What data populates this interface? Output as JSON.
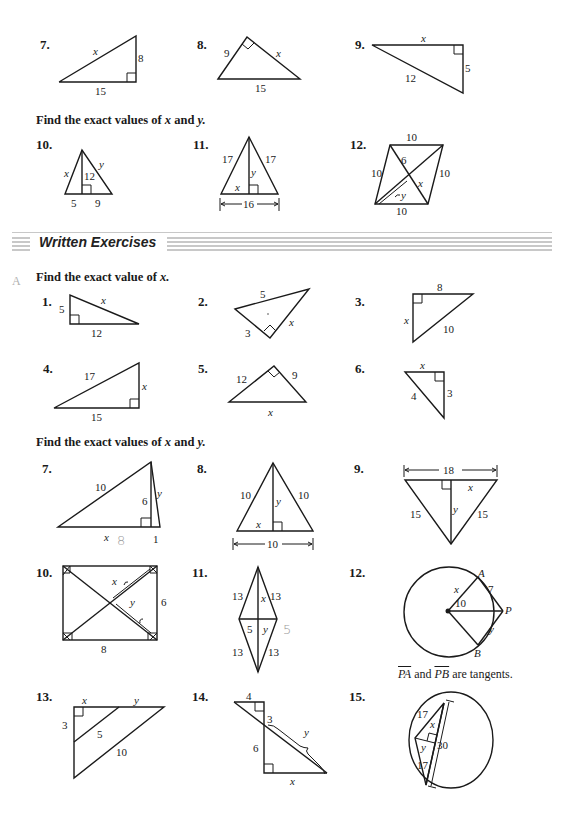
{
  "page": {
    "top_section": {
      "problems_top": [
        {
          "number": "7.",
          "labels": {
            "hyp": "x",
            "leg_vertical": "8",
            "leg_base": "15"
          }
        },
        {
          "number": "8.",
          "labels": {
            "leg_left": "9",
            "leg_right": "x",
            "hyp_base": "15"
          }
        },
        {
          "number": "9.",
          "labels": {
            "leg_top": "x",
            "leg_vertical": "5",
            "hyp": "12"
          }
        }
      ],
      "instruction_xy": "Find the exact values of",
      "instruction_xy_vars": {
        "x": "x",
        "and": "and",
        "y": "y."
      },
      "problems_xy": [
        {
          "number": "10.",
          "labels": {
            "left": "x",
            "altitude": "12",
            "right": "y",
            "base_left": "5",
            "base_right": "9"
          }
        },
        {
          "number": "11.",
          "labels": {
            "left": "17",
            "right": "17",
            "altitude": "y",
            "half_base": "x",
            "base": "16"
          }
        },
        {
          "number": "12.",
          "labels": {
            "top": "10",
            "left": "10",
            "right": "10",
            "bottom": "10",
            "half_diag": "6",
            "segment_x": "x",
            "segment_y": "y"
          }
        }
      ]
    },
    "section_banner": {
      "title": "Written Exercises"
    },
    "written": {
      "margin_label": "A",
      "instruction_x": "Find the exact value of",
      "instruction_x_var": "x.",
      "problems_x": [
        {
          "number": "1.",
          "labels": {
            "leg_vertical": "5",
            "hyp": "x",
            "leg_base": "12"
          }
        },
        {
          "number": "2.",
          "labels": {
            "hyp": "5",
            "leg_left": "3",
            "leg_right": "x"
          }
        },
        {
          "number": "3.",
          "labels": {
            "leg_top": "8",
            "leg_vertical": "x",
            "hyp": "10"
          }
        },
        {
          "number": "4.",
          "labels": {
            "hyp": "17",
            "leg_vertical": "x",
            "leg_base": "15"
          }
        },
        {
          "number": "5.",
          "labels": {
            "leg_left": "12",
            "leg_right": "9",
            "hyp": "x"
          }
        },
        {
          "number": "6.",
          "labels": {
            "leg_top": "x",
            "hyp": "4",
            "leg_vertical": "3"
          }
        }
      ],
      "instruction_xy": "Find the exact values of",
      "instruction_xy_vars": {
        "x": "x",
        "and": "and",
        "y": "y."
      },
      "problems_xy": [
        {
          "number": "7.",
          "labels": {
            "hyp": "10",
            "altitude": "6",
            "right_side": "y",
            "base_x": "x",
            "base_small": "1",
            "handwritten": "8"
          }
        },
        {
          "number": "8.",
          "labels": {
            "left": "10",
            "right": "10",
            "altitude": "y",
            "half_base": "x",
            "base": "10"
          }
        },
        {
          "number": "9.",
          "labels": {
            "top": "18",
            "half_top": "x",
            "left": "15",
            "right": "15",
            "altitude": "y"
          }
        },
        {
          "number": "10.",
          "labels": {
            "half_diag_x": "x",
            "half_diag_y": "y",
            "side": "6",
            "base": "8"
          }
        },
        {
          "number": "11.",
          "labels": {
            "upper_left": "13",
            "upper_right": "13",
            "lower_left": "13",
            "lower_right": "13",
            "upper_half": "x",
            "half_width_left": "5",
            "half_width_right": "y",
            "handwritten": "5"
          }
        },
        {
          "number": "12.",
          "labels": {
            "radius_x": "x",
            "tangent_pa": "7",
            "op": "10",
            "tangent_pb": "y",
            "point_a": "A",
            "point_b": "B",
            "point_p": "P"
          },
          "caption": {
            "pa": "PA",
            "and": "and",
            "pb": "PB",
            "rest": "are tangents."
          }
        },
        {
          "number": "13.",
          "labels": {
            "top_x": "x",
            "top_y": "y",
            "left": "3",
            "inner": "5",
            "outer": "10"
          }
        },
        {
          "number": "14.",
          "labels": {
            "top": "4",
            "upper_vertical": "3",
            "lower_vertical": "6",
            "diag_y": "y",
            "base": "x"
          }
        },
        {
          "number": "15.",
          "labels": {
            "radius_upper": "17",
            "radius_lower": "17",
            "half_chord": "x",
            "distance": "y",
            "chord": "30"
          }
        }
      ]
    }
  }
}
